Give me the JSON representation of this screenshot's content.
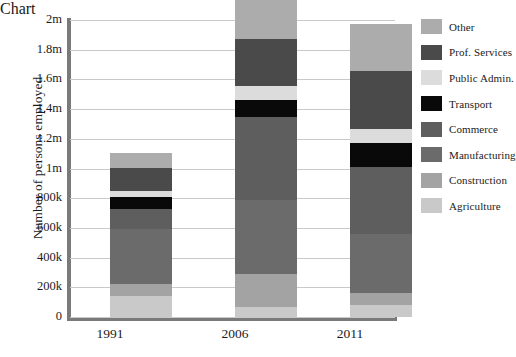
{
  "chart_data": {
    "type": "bar",
    "subtype": "stacked-bar",
    "title": "",
    "xlabel": "",
    "ylabel": "Number of persons employed",
    "categories": [
      "1991",
      "2006",
      "2011"
    ],
    "ylim": [
      0,
      2000000
    ],
    "ytick_values": [
      0,
      200000,
      400000,
      600000,
      800000,
      1000000,
      1200000,
      1400000,
      1600000,
      1800000,
      2000000
    ],
    "ytick_labels": [
      "0",
      "200k",
      "400k",
      "600k",
      "800k",
      "1m",
      "1.2m",
      "1.4m",
      "1.6m",
      "1.8m",
      "2m"
    ],
    "grid": true,
    "legend_position": "right",
    "stack_order_bottom_to_top": [
      "Agriculture",
      "Construction",
      "Manufacturing",
      "Commerce",
      "Transport",
      "Public Admin.",
      "Prof. Services",
      "Other"
    ],
    "series": [
      {
        "name": "Agriculture",
        "color": "#c9c9c9",
        "values": [
          140000,
          65000,
          80000
        ]
      },
      {
        "name": "Construction",
        "color": "#a3a3a3",
        "values": [
          80000,
          225000,
          80000
        ]
      },
      {
        "name": "Manufacturing",
        "color": "#6b6b6b",
        "values": [
          375000,
          500000,
          400000
        ]
      },
      {
        "name": "Commerce",
        "color": "#5e5e5e",
        "values": [
          135000,
          560000,
          450000
        ]
      },
      {
        "name": "Transport",
        "color": "#090909",
        "values": [
          75000,
          110000,
          160000
        ]
      },
      {
        "name": "Public Admin.",
        "color": "#dcdcdc",
        "values": [
          45000,
          95000,
          95000
        ]
      },
      {
        "name": "Prof. Services",
        "color": "#4a4a4a",
        "values": [
          155000,
          320000,
          390000
        ]
      },
      {
        "name": "Other",
        "color": "#acacac",
        "values": [
          100000,
          325000,
          320000
        ]
      }
    ],
    "totals": [
      1105000,
      2200000,
      1975000
    ],
    "bar_totals_displayed": [
      1125000,
      1920000,
      1810000
    ]
  },
  "axis": {
    "ylabel": "Number of persons employed",
    "yticks": [
      "2m",
      "1.8m",
      "1.6m",
      "1.4m",
      "1.2m",
      "1m",
      "800k",
      "600k",
      "400k",
      "200k",
      "0"
    ],
    "xticks": [
      "1991",
      "2006",
      "2011"
    ]
  },
  "legend": {
    "items": [
      {
        "label": "Other",
        "color": "#acacac"
      },
      {
        "label": "Prof. Services",
        "color": "#4a4a4a"
      },
      {
        "label": "Public Admin.",
        "color": "#dcdcdc"
      },
      {
        "label": "Transport",
        "color": "#090909"
      },
      {
        "label": "Commerce",
        "color": "#5e5e5e"
      },
      {
        "label": "Manufacturing",
        "color": "#6b6b6b"
      },
      {
        "label": "Construction",
        "color": "#a3a3a3"
      },
      {
        "label": "Agriculture",
        "color": "#c9c9c9"
      }
    ]
  },
  "colors": {
    "axis": "#7a7a7a",
    "grid": "#c9c9c9",
    "background": "#ffffff",
    "text": "#1b1b1b"
  }
}
